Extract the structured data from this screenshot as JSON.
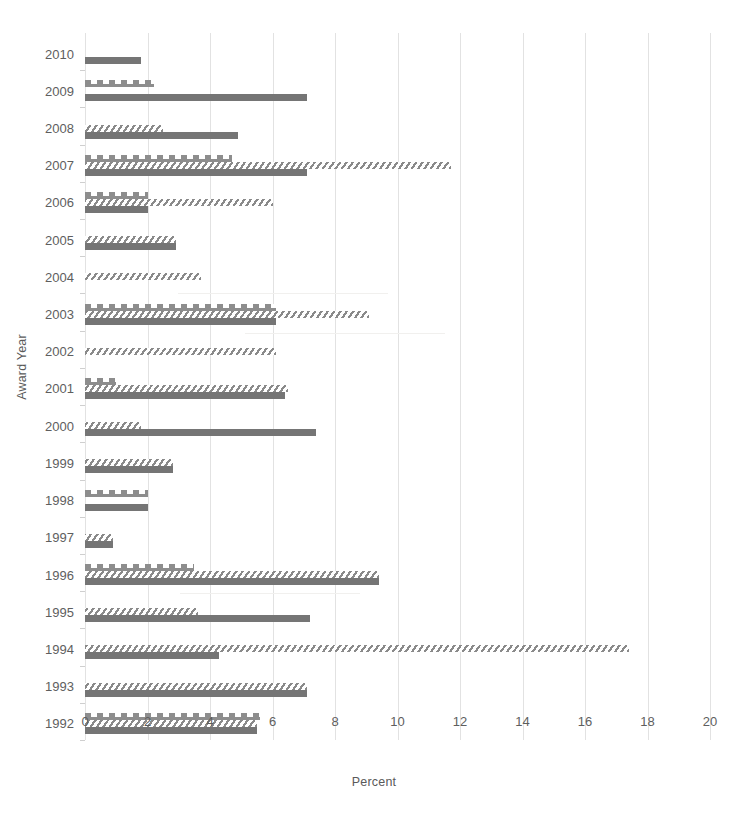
{
  "chart_data": {
    "type": "bar",
    "orientation": "horizontal",
    "title": "",
    "xlabel": "Percent",
    "ylabel": "Award Year",
    "xlim": [
      0,
      20
    ],
    "xticks": [
      0,
      2,
      4,
      6,
      8,
      10,
      12,
      14,
      16,
      18,
      20
    ],
    "grid": "vertical",
    "legend": "none",
    "categories": [
      "2010",
      "2009",
      "2008",
      "2007",
      "2006",
      "2005",
      "2004",
      "2003",
      "2002",
      "2001",
      "2000",
      "1999",
      "1998",
      "1997",
      "1996",
      "1995",
      "1994",
      "1993",
      "1992"
    ],
    "series": [
      {
        "name": "series-1-dotted",
        "pattern": "dotted",
        "color": "#8d8d8d",
        "values": [
          0,
          2.2,
          0,
          4.7,
          2.0,
          0,
          0,
          6.1,
          0,
          1.0,
          0,
          0,
          2.0,
          0,
          3.5,
          0,
          0,
          0,
          5.6
        ]
      },
      {
        "name": "series-2-hatched",
        "pattern": "diagonal-hatch",
        "color": "#8a8a8a",
        "values": [
          0,
          0,
          2.5,
          11.7,
          6.0,
          2.9,
          3.7,
          9.1,
          6.1,
          6.5,
          1.8,
          2.8,
          0,
          0.9,
          9.4,
          3.6,
          17.4,
          7.1,
          5.5
        ]
      },
      {
        "name": "series-3-solid",
        "pattern": "solid",
        "color": "#757575",
        "values": [
          1.8,
          7.1,
          4.9,
          7.1,
          2.0,
          2.9,
          0,
          6.1,
          0,
          6.4,
          7.4,
          2.8,
          2.0,
          0.9,
          9.4,
          7.2,
          4.3,
          7.1,
          5.5
        ]
      }
    ]
  }
}
